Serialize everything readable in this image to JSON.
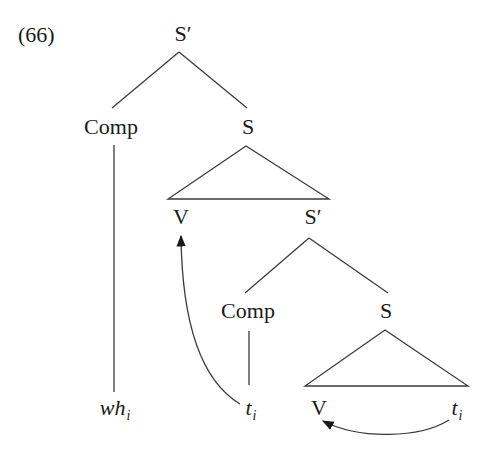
{
  "example": {
    "number": "(66)"
  },
  "tree": {
    "root": {
      "label": "S",
      "prime": "′"
    },
    "comp1": {
      "label": "Comp"
    },
    "s1": {
      "label": "S"
    },
    "v1": {
      "label": "V"
    },
    "sbar2": {
      "label": "S",
      "prime": "′"
    },
    "comp2": {
      "label": "Comp"
    },
    "s2": {
      "label": "S"
    },
    "v2": {
      "label": "V"
    },
    "leaves": {
      "wh": {
        "base": "wh",
        "index": "i"
      },
      "trace_comp": {
        "base": "t",
        "index": "i"
      },
      "trace_obj": {
        "base": "t",
        "index": "i"
      }
    }
  },
  "movements": [
    {
      "from": "trace_comp",
      "to": "v1",
      "description": "curved arrow from t_i under lower Comp up to upper V"
    },
    {
      "from": "trace_obj",
      "to": "v2",
      "description": "curved arrow from rightmost t_i back to lower V"
    }
  ],
  "colors": {
    "ink": "#1a1a1a",
    "lines": "#3a3a3a",
    "background": "#ffffff"
  }
}
